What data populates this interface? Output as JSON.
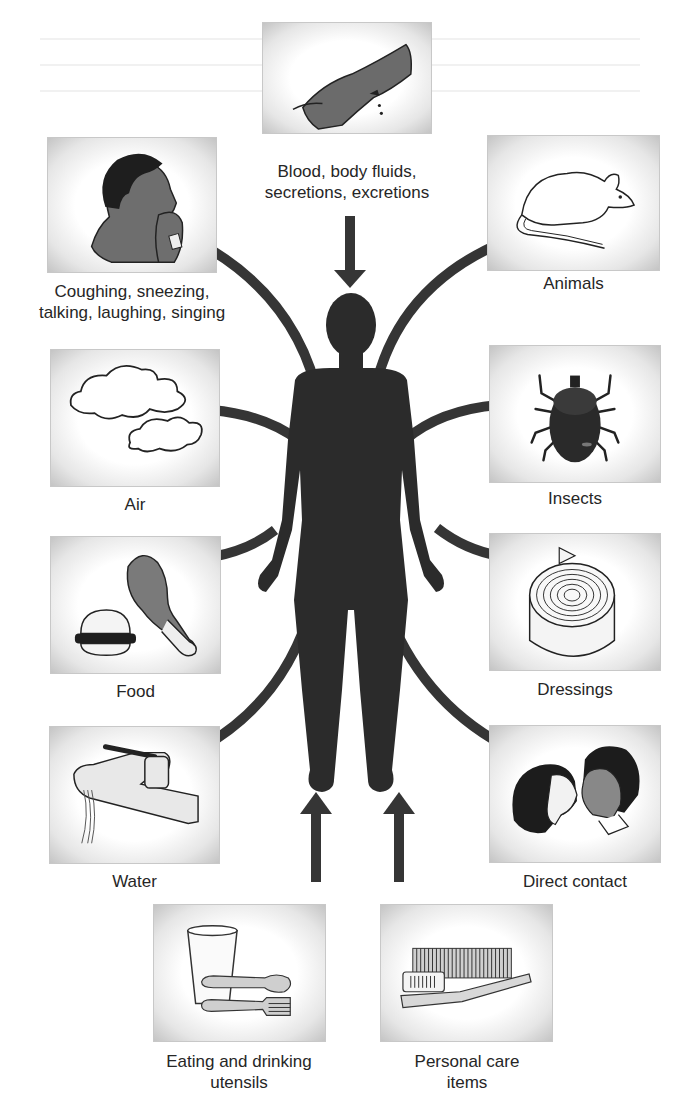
{
  "diagram": {
    "center": {
      "label": "Human body",
      "icon": "human-silhouette-icon"
    },
    "colors": {
      "connector": "#333333",
      "figure": "#2b2b2b",
      "tile_edge": "#c4c4c4",
      "text": "#262626"
    },
    "sources": [
      {
        "id": "blood",
        "lines": [
          "Blood, body fluids,",
          "secretions, excretions"
        ],
        "icon": "bleeding-hand-icon",
        "connector": "straight-arrow-down"
      },
      {
        "id": "coughing",
        "lines": [
          "Coughing, sneezing,",
          "talking, laughing, singing"
        ],
        "icon": "coughing-person-icon",
        "connector": "curve"
      },
      {
        "id": "animals",
        "lines": [
          "Animals"
        ],
        "icon": "mouse-icon",
        "connector": "curve"
      },
      {
        "id": "air",
        "lines": [
          "Air"
        ],
        "icon": "clouds-icon",
        "connector": "curve"
      },
      {
        "id": "insects",
        "lines": [
          "Insects"
        ],
        "icon": "tick-icon",
        "connector": "curve"
      },
      {
        "id": "food",
        "lines": [
          "Food"
        ],
        "icon": "burger-drumstick-icon",
        "connector": "curve"
      },
      {
        "id": "dressings",
        "lines": [
          "Dressings"
        ],
        "icon": "bandage-roll-icon",
        "connector": "curve"
      },
      {
        "id": "water",
        "lines": [
          "Water"
        ],
        "icon": "faucet-icon",
        "connector": "curve"
      },
      {
        "id": "direct",
        "lines": [
          "Direct contact"
        ],
        "icon": "kissing-couple-icon",
        "connector": "curve"
      },
      {
        "id": "utensils",
        "lines": [
          "Eating and drinking",
          "utensils"
        ],
        "icon": "cup-spoon-fork-icon",
        "connector": "straight-arrow-up"
      },
      {
        "id": "personal",
        "lines": [
          "Personal care",
          "items"
        ],
        "icon": "comb-toothbrush-icon",
        "connector": "straight-arrow-up"
      }
    ]
  }
}
